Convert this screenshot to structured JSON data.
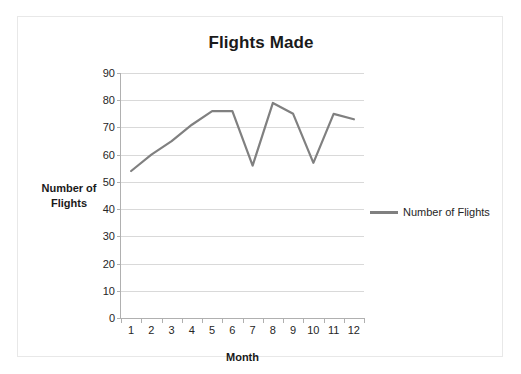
{
  "chart_data": {
    "type": "line",
    "title": "Flights Made",
    "xlabel": "Month",
    "ylabel": "Number of Flights",
    "categories": [
      "1",
      "2",
      "3",
      "4",
      "5",
      "6",
      "7",
      "8",
      "9",
      "10",
      "11",
      "12"
    ],
    "series": [
      {
        "name": "Number of Flights",
        "values": [
          54,
          60,
          65,
          71,
          76,
          76,
          56,
          79,
          75,
          57,
          75,
          73
        ],
        "color": "#808080"
      }
    ],
    "ylim": [
      0,
      90
    ],
    "yticks": [
      0,
      10,
      20,
      30,
      40,
      50,
      60,
      70,
      80,
      90
    ],
    "ytick_labels": [
      "0",
      "10",
      "20",
      "30",
      "40",
      "50",
      "60",
      "70",
      "80",
      "90"
    ],
    "grid": true,
    "legend_position": "right",
    "legend_entries": [
      "Number of Flights"
    ]
  },
  "legend": {
    "label": "Number of Flights",
    "swatch_color": "#808080"
  },
  "axis": {
    "x_title": "Month",
    "y_title_line1": "Number of",
    "y_title_line2": "Flights"
  },
  "colors": {
    "series": "#808080",
    "gridline": "#d9d9d9",
    "axis": "#b0b0b0",
    "border": "#e8e8e8",
    "text": "#262626",
    "title": "#1a1a1a"
  }
}
